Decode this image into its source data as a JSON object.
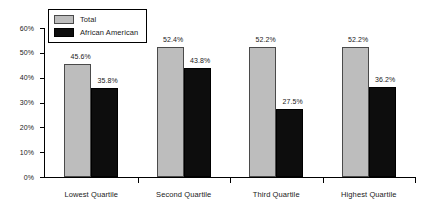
{
  "chart_data": {
    "type": "bar",
    "title": "",
    "xlabel": "",
    "ylabel": "",
    "ylim": [
      0,
      60
    ],
    "ytick_labels": [
      "0%",
      "10%",
      "20%",
      "30%",
      "40%",
      "50%",
      "60%"
    ],
    "ytick_values": [
      0,
      10,
      20,
      30,
      40,
      50,
      60
    ],
    "grid": false,
    "legend_position": "upper-left-inside",
    "categories": [
      "Lowest Quartile",
      "Second Quartile",
      "Third Quartile",
      "Highest Quartile"
    ],
    "series": [
      {
        "name": "Total",
        "color": "#bdbdbd",
        "values": [
          45.6,
          52.4,
          52.2,
          52.2
        ],
        "labels": [
          "45.6%",
          "52.4%",
          "52.2%",
          "52.2%"
        ]
      },
      {
        "name": "African American",
        "color": "#0d0d0d",
        "values": [
          35.8,
          43.8,
          27.5,
          36.2
        ],
        "labels": [
          "35.8%",
          "43.8%",
          "27.5%",
          "36.2%"
        ]
      }
    ]
  },
  "legend": {
    "items": [
      {
        "label": "Total"
      },
      {
        "label": "African American"
      }
    ]
  }
}
